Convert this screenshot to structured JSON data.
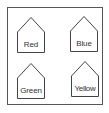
{
  "diagram": {
    "frame_color": "#555555",
    "stroke_color": "#444444",
    "houses": [
      {
        "label": "Red",
        "position": "top-left"
      },
      {
        "label": "Blue",
        "position": "top-right"
      },
      {
        "label": "Green",
        "position": "bottom-left"
      },
      {
        "label": "Yellow",
        "position": "bottom-right"
      }
    ]
  }
}
